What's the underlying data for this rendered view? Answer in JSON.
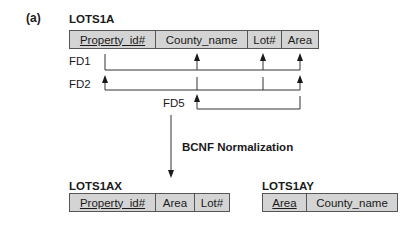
{
  "figure_label": "(a)",
  "source_relation": {
    "name": "LOTS1A",
    "attributes": [
      {
        "name": "Property_id#",
        "primary_key": true
      },
      {
        "name": "County_name",
        "primary_key": false
      },
      {
        "name": "Lot#",
        "primary_key": false
      },
      {
        "name": "Area",
        "primary_key": false
      }
    ]
  },
  "functional_dependencies": [
    {
      "label": "FD1",
      "lhs": [
        "Property_id#"
      ],
      "rhs": [
        "County_name",
        "Lot#",
        "Area"
      ]
    },
    {
      "label": "FD2",
      "lhs": [
        "County_name",
        "Lot#"
      ],
      "rhs": [
        "Property_id#",
        "Area"
      ]
    },
    {
      "label": "FD5",
      "lhs": [
        "Area"
      ],
      "rhs": [
        "County_name"
      ]
    }
  ],
  "transformation": {
    "label": "BCNF Normalization"
  },
  "result_relations": [
    {
      "name": "LOTS1AX",
      "attributes": [
        {
          "name": "Property_id#",
          "primary_key": true
        },
        {
          "name": "Area",
          "primary_key": false
        },
        {
          "name": "Lot#",
          "primary_key": false
        }
      ]
    },
    {
      "name": "LOTS1AY",
      "attributes": [
        {
          "name": "Area",
          "primary_key": true
        },
        {
          "name": "County_name",
          "primary_key": false
        }
      ]
    }
  ]
}
